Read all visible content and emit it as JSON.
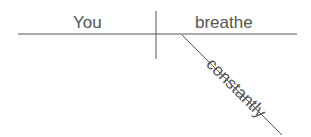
{
  "diagram": {
    "type": "sentence-diagram",
    "sentence": [
      "You",
      "breathe",
      "constantly"
    ],
    "subject": {
      "label": "You"
    },
    "predicate": {
      "label": "breathe"
    },
    "modifiers": [
      {
        "label": "constantly",
        "role": "adverb",
        "modifies": "breathe"
      }
    ],
    "colors": {
      "line": "#555555",
      "text": "#555555",
      "background": "#ffffff"
    }
  }
}
